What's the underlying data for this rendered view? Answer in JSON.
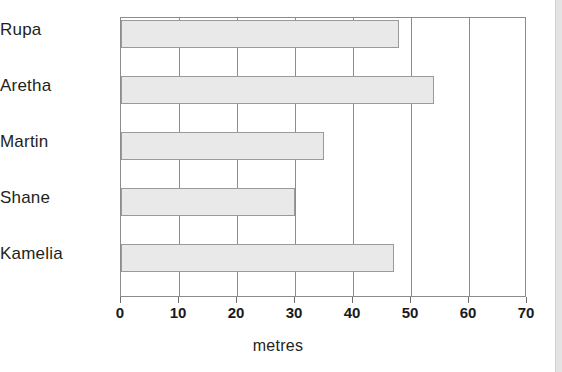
{
  "chart_data": {
    "type": "bar",
    "orientation": "horizontal",
    "title": "",
    "subtitle": "",
    "categories": [
      "Rupa",
      "Aretha",
      "Martin",
      "Shane",
      "Kamelia"
    ],
    "values": [
      48,
      54,
      35,
      30,
      47
    ],
    "xlabel": "metres",
    "ylabel": "",
    "xlim": [
      0,
      70
    ],
    "xticks": [
      0,
      10,
      20,
      30,
      40,
      50,
      60,
      70
    ],
    "xtick_labels": [
      "0",
      "10",
      "20",
      "30",
      "40",
      "50",
      "60",
      "70"
    ],
    "grid": true,
    "grid_axis": "x",
    "legend": false,
    "legend_position": "none",
    "series": [
      {
        "name": "metres",
        "values": [
          48,
          54,
          35,
          30,
          47
        ]
      }
    ],
    "colors": {
      "bar_fill": "#e9e9e9",
      "bar_border": "#9a9a9a",
      "gridline": "#8c8c8c",
      "axis_border": "#8c8c8c",
      "tick_label": "#1a1a1a",
      "category_label": "#231f20",
      "background": "#ffffff",
      "right_edge_strip": "#e4e4e4"
    }
  }
}
